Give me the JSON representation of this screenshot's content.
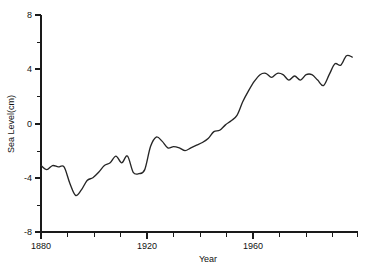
{
  "chart_data": {
    "type": "line",
    "title": "",
    "xlabel": "Year",
    "ylabel": "Sea Level(cm)",
    "xlim": [
      1880,
      1990
    ],
    "ylim": [
      -8,
      8
    ],
    "grid": false,
    "legend": null,
    "x_ticks_major": [
      1880,
      1920,
      1960
    ],
    "x_tick_labels": [
      "1880",
      "1920",
      "1960"
    ],
    "x_ticks_minor": [
      1890,
      1900,
      1910,
      1930,
      1940,
      1950,
      1970,
      1980,
      1990
    ],
    "y_ticks_major": [
      8,
      4,
      0,
      -4,
      -8
    ],
    "y_tick_labels": [
      "8",
      "4",
      "0",
      "-4",
      "-8"
    ],
    "y_ticks_minor": [
      6,
      2,
      -2,
      -6
    ],
    "line_color": "#262626",
    "series": [
      {
        "name": "Global mean sea level",
        "x": [
          1880,
          1882,
          1884,
          1886,
          1888,
          1890,
          1892,
          1894,
          1896,
          1898,
          1900,
          1902,
          1904,
          1906,
          1908,
          1910,
          1912,
          1914,
          1916,
          1918,
          1920,
          1922,
          1924,
          1926,
          1928,
          1930,
          1932,
          1934,
          1936,
          1938,
          1940,
          1942,
          1944,
          1946,
          1948,
          1950,
          1952,
          1954,
          1956,
          1958,
          1960,
          1962,
          1964,
          1966,
          1968,
          1970,
          1972,
          1974,
          1976,
          1978,
          1980,
          1982,
          1984,
          1986,
          1988
        ],
        "values": [
          -3.1,
          -3.4,
          -3.1,
          -3.2,
          -3.2,
          -4.4,
          -5.3,
          -4.9,
          -4.2,
          -4.0,
          -3.6,
          -3.1,
          -2.9,
          -2.4,
          -2.9,
          -2.4,
          -3.6,
          -3.7,
          -3.4,
          -1.7,
          -1.0,
          -1.3,
          -1.8,
          -1.7,
          -1.8,
          -2.0,
          -1.8,
          -1.6,
          -1.4,
          -1.1,
          -0.6,
          -0.5,
          -0.1,
          0.2,
          0.6,
          1.6,
          2.4,
          3.1,
          3.6,
          3.7,
          3.4,
          3.7,
          3.6,
          3.2,
          3.5,
          3.2,
          3.6,
          3.6,
          3.2,
          2.8,
          3.6,
          4.4,
          4.3,
          5.0,
          4.9
        ]
      }
    ]
  },
  "axes": {
    "x_axis_name": "year-axis",
    "y_axis_name": "sea-level-axis"
  }
}
